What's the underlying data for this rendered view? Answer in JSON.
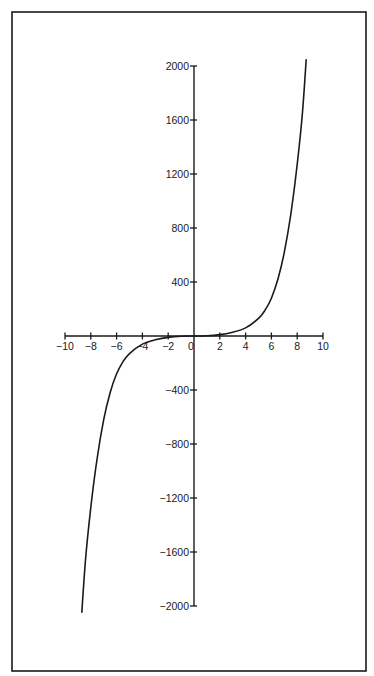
{
  "chart_data": {
    "type": "line",
    "title": "",
    "xlabel": "",
    "ylabel": "",
    "xlim": [
      -10,
      10
    ],
    "ylim": [
      -2000,
      2000
    ],
    "grid": false,
    "legend": null,
    "x_ticks": [
      -10,
      -8,
      -6,
      -4,
      -2,
      0,
      2,
      4,
      6,
      8,
      10
    ],
    "x_tick_labels": [
      "-10",
      "-8",
      "-6",
      "-4",
      "-2",
      "0",
      "2",
      "4",
      "6",
      "8",
      "10"
    ],
    "y_ticks": [
      2000,
      1600,
      1200,
      800,
      400,
      -400,
      -800,
      -1200,
      -1600,
      -2000
    ],
    "y_tick_labels": [
      "2000",
      "1600",
      "1200",
      "800",
      "400",
      "-400",
      "-800",
      "-1200",
      "-1600",
      "-2000"
    ],
    "series": [
      {
        "name": "curve",
        "x": [
          -8.7,
          -8.4,
          -8,
          -7.5,
          -7,
          -6.5,
          -6,
          -5.5,
          -5,
          -4,
          -3,
          -2,
          -1,
          0,
          1,
          2,
          3,
          4,
          5,
          5.5,
          6,
          6.5,
          7,
          7.5,
          8,
          8.4,
          8.7
        ],
        "y": [
          -2050,
          -1650,
          -1270,
          -900,
          -620,
          -420,
          -280,
          -190,
          -130,
          -60,
          -28,
          -10,
          -2,
          0,
          2,
          10,
          28,
          60,
          130,
          190,
          280,
          420,
          620,
          900,
          1270,
          1650,
          2050
        ]
      }
    ]
  }
}
